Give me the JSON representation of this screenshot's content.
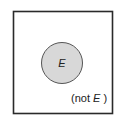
{
  "diagram": {
    "type": "venn",
    "event_label": "E",
    "complement_label_prefix": "(not ",
    "complement_label_var": "E",
    "complement_label_suffix": " )",
    "colors": {
      "event_fill": "#d8d8d8",
      "event_stroke": "#555555",
      "frame_stroke": "#2a2a2a"
    }
  }
}
